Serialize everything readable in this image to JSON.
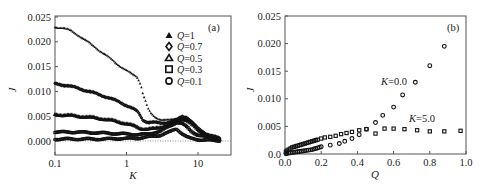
{
  "chart_data": [
    {
      "panel": "(a)",
      "type": "scatter",
      "xlabel": "K",
      "ylabel": "J",
      "xscale": "log",
      "xlim": [
        0.1,
        25
      ],
      "ylim": [
        -0.002,
        0.025
      ],
      "xticks": [
        0.1,
        1,
        10
      ],
      "xtick_labels": [
        "0.1",
        "1",
        "10"
      ],
      "yticks": [
        0.0,
        0.005,
        0.01,
        0.015,
        0.02,
        0.025
      ],
      "ytick_labels": [
        "0.000",
        "0.005",
        "0.010",
        "0.015",
        "0.020",
        "0.025"
      ],
      "reference_line": {
        "y": 0.0,
        "style": "dotted"
      },
      "legend_position": "upper right",
      "series": [
        {
          "name": "Q=1",
          "marker": "triangle-filled",
          "x": [
            0.1,
            0.13,
            0.17,
            0.22,
            0.3,
            0.4,
            0.55,
            0.75,
            1.0,
            1.2,
            1.4,
            1.5,
            1.6,
            1.7,
            1.8,
            1.9,
            2.0,
            2.2,
            2.5,
            3.0,
            4.0,
            5.0,
            6.0,
            7.0,
            8.0,
            9.0,
            10.0,
            12.0,
            15.0,
            20.0
          ],
          "y": [
            0.023,
            0.0228,
            0.0222,
            0.0212,
            0.0198,
            0.0185,
            0.017,
            0.0155,
            0.0142,
            0.0135,
            0.013,
            0.0122,
            0.0112,
            0.0095,
            0.0085,
            0.0075,
            0.0065,
            0.0055,
            0.0048,
            0.0044,
            0.0042,
            0.0045,
            0.0048,
            0.0046,
            0.004,
            0.003,
            0.0022,
            0.0015,
            0.001,
            0.0005
          ]
        },
        {
          "name": "Q=0.7",
          "marker": "diamond-open",
          "x": [
            0.1,
            0.15,
            0.2,
            0.3,
            0.4,
            0.55,
            0.75,
            1.0,
            1.2,
            1.4,
            1.5,
            1.7,
            2.0,
            2.5,
            3.0,
            4.0,
            5.0,
            6.0,
            7.0,
            8.0,
            10.0,
            13.0,
            16.0,
            20.0
          ],
          "y": [
            0.0115,
            0.0112,
            0.0107,
            0.01,
            0.0094,
            0.0088,
            0.008,
            0.0072,
            0.0066,
            0.006,
            0.0055,
            0.0042,
            0.0038,
            0.0037,
            0.0036,
            0.0038,
            0.0042,
            0.005,
            0.0048,
            0.004,
            0.0025,
            0.0015,
            0.001,
            0.0005
          ]
        },
        {
          "name": "Q=0.5",
          "marker": "triangle-open",
          "x": [
            0.1,
            0.15,
            0.2,
            0.3,
            0.5,
            0.7,
            1.0,
            1.3,
            1.6,
            2.0,
            2.5,
            3.0,
            4.0,
            5.0,
            6.0,
            7.0,
            8.0,
            10.0,
            13.0,
            16.0,
            20.0
          ],
          "y": [
            0.0053,
            0.0052,
            0.005,
            0.0048,
            0.0044,
            0.004,
            0.0035,
            0.003,
            0.0025,
            0.0024,
            0.0025,
            0.0028,
            0.0033,
            0.004,
            0.0045,
            0.0042,
            0.0035,
            0.0022,
            0.0013,
            0.0008,
            0.0004
          ]
        },
        {
          "name": "Q=0.3",
          "marker": "square-open",
          "x": [
            0.1,
            0.2,
            0.3,
            0.5,
            0.7,
            1.0,
            1.5,
            2.0,
            3.0,
            4.0,
            5.0,
            6.0,
            7.0,
            8.0,
            10.0,
            13.0,
            16.0,
            20.0
          ],
          "y": [
            0.0018,
            0.0018,
            0.0017,
            0.0016,
            0.0015,
            0.0014,
            0.0013,
            0.0014,
            0.002,
            0.003,
            0.0038,
            0.0035,
            0.0028,
            0.002,
            0.0012,
            0.0008,
            0.0005,
            0.0003
          ]
        },
        {
          "name": "Q=0.1",
          "marker": "circle-open",
          "x": [
            0.1,
            0.2,
            0.3,
            0.5,
            0.7,
            1.0,
            1.5,
            2.0,
            3.0,
            4.0,
            4.5,
            5.0,
            6.0,
            7.0,
            8.0,
            10.0,
            13.0,
            16.0,
            20.0
          ],
          "y": [
            0.0004,
            0.0004,
            0.0004,
            0.0004,
            0.0005,
            0.0005,
            0.0006,
            0.0008,
            0.0012,
            0.0018,
            0.0022,
            0.0025,
            0.0015,
            0.0008,
            0.0005,
            0.0003,
            0.0002,
            0.0001,
            0.0001
          ]
        }
      ]
    },
    {
      "panel": "(b)",
      "type": "scatter",
      "xlabel": "Q",
      "ylabel": "J",
      "xlim": [
        0.0,
        1.0
      ],
      "ylim": [
        0.0,
        0.025
      ],
      "xticks": [
        0.0,
        0.2,
        0.4,
        0.6,
        0.8,
        1.0
      ],
      "xtick_labels": [
        "0.0",
        "0.2",
        "0.4",
        "0.6",
        "0.8",
        "1.0"
      ],
      "yticks": [
        0.0,
        0.005,
        0.01,
        0.015,
        0.02,
        0.025
      ],
      "ytick_labels": [
        "0.0",
        "0.005",
        "0.010",
        "0.015",
        "0.020",
        "0.025"
      ],
      "annotations": [
        {
          "text": "K=0.0",
          "x": 0.52,
          "y": 0.0128
        },
        {
          "text": "K=5.0",
          "x": 0.67,
          "y": 0.0058
        }
      ],
      "series": [
        {
          "name": "K=0.0",
          "marker": "circle-open",
          "x": [
            0.005,
            0.01,
            0.02,
            0.03,
            0.04,
            0.05,
            0.06,
            0.07,
            0.08,
            0.09,
            0.1,
            0.11,
            0.12,
            0.13,
            0.14,
            0.15,
            0.16,
            0.17,
            0.18,
            0.19,
            0.2,
            0.25,
            0.3,
            0.33,
            0.37,
            0.41,
            0.45,
            0.5,
            0.54,
            0.6,
            0.65,
            0.72,
            0.8,
            0.88
          ],
          "y": [
            5e-05,
            0.0001,
            0.00015,
            0.0002,
            0.00025,
            0.0003,
            0.00035,
            0.0004,
            0.00045,
            0.0005,
            0.00055,
            0.0006,
            0.00065,
            0.0007,
            0.00075,
            0.0008,
            0.0009,
            0.001,
            0.0011,
            0.0012,
            0.0013,
            0.0016,
            0.0019,
            0.0023,
            0.0028,
            0.0035,
            0.0045,
            0.0057,
            0.007,
            0.0085,
            0.0107,
            0.013,
            0.016,
            0.0195
          ]
        },
        {
          "name": "K=5.0",
          "marker": "square-open",
          "x": [
            0.005,
            0.01,
            0.02,
            0.03,
            0.04,
            0.05,
            0.06,
            0.07,
            0.08,
            0.09,
            0.1,
            0.11,
            0.12,
            0.13,
            0.14,
            0.15,
            0.16,
            0.17,
            0.18,
            0.2,
            0.22,
            0.25,
            0.28,
            0.31,
            0.34,
            0.37,
            0.41,
            0.45,
            0.5,
            0.55,
            0.6,
            0.66,
            0.73,
            0.8,
            0.88,
            0.97
          ],
          "y": [
            0.0004,
            0.0006,
            0.0008,
            0.001,
            0.0012,
            0.0013,
            0.0014,
            0.0015,
            0.0016,
            0.0017,
            0.0018,
            0.0019,
            0.002,
            0.0021,
            0.0022,
            0.0023,
            0.0024,
            0.0025,
            0.0026,
            0.0028,
            0.003,
            0.0031,
            0.0033,
            0.0036,
            0.0038,
            0.004,
            0.0043,
            0.0045,
            0.0037,
            0.0046,
            0.0046,
            0.0045,
            0.0043,
            0.0041,
            0.0041,
            0.0042
          ]
        }
      ]
    }
  ],
  "panel_a": {
    "tag": "(a)",
    "xlabel": "K",
    "ylabel": "J",
    "legend": [
      {
        "symbol": "Q",
        "label": "=1",
        "marker": "triangle-filled"
      },
      {
        "symbol": "Q",
        "label": "=0.7",
        "marker": "diamond-open"
      },
      {
        "symbol": "Q",
        "label": "=0.5",
        "marker": "triangle-open"
      },
      {
        "symbol": "Q",
        "label": "=0.3",
        "marker": "square-open"
      },
      {
        "symbol": "Q",
        "label": "=0.1",
        "marker": "circle-open"
      }
    ]
  },
  "panel_b": {
    "tag": "(b)",
    "xlabel": "Q",
    "ylabel": "J",
    "annotation_k0": {
      "symbol": "K",
      "label": "=0.0"
    },
    "annotation_k5": {
      "symbol": "K",
      "label": "=5.0"
    }
  }
}
